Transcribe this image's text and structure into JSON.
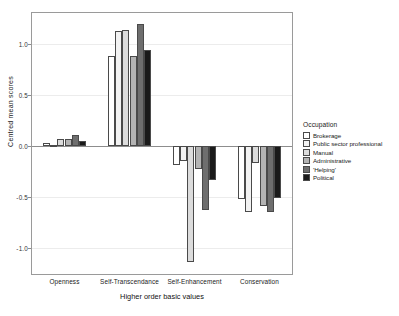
{
  "chart_data": {
    "type": "bar",
    "title": "",
    "xlabel": "Higher order basic values",
    "ylabel": "Centred mean scores",
    "categories": [
      "Openness",
      "Self-Transcendance",
      "Self-Enhancement",
      "Conservation"
    ],
    "ylim": [
      -1.25,
      1.3
    ],
    "yticks": [
      1.0,
      0.5,
      0.0,
      -0.5,
      -1.0
    ],
    "ytick_labels": [
      "1.0",
      "0.5",
      "0.0",
      "-0.5",
      "-1.0"
    ],
    "grid": false,
    "legend_position": "right",
    "legend_title": "Occupation",
    "series": [
      {
        "name": "Brokerage",
        "color": "#ffffff",
        "values": [
          0.03,
          0.88,
          -0.19,
          -0.52
        ]
      },
      {
        "name": "Public sector professional",
        "color": "#f2f2f2",
        "values": [
          0.01,
          1.12,
          -0.15,
          -0.64
        ]
      },
      {
        "name": "Manual",
        "color": "#dcdcdc",
        "values": [
          0.07,
          1.13,
          -1.13,
          -0.17
        ]
      },
      {
        "name": "Administrative",
        "color": "#b4b4b4",
        "values": [
          0.07,
          0.88,
          -0.22,
          -0.59
        ]
      },
      {
        "name": "'Helping'",
        "color": "#6e6e6e",
        "values": [
          0.11,
          1.19,
          -0.62,
          -0.64
        ]
      },
      {
        "name": "Political",
        "color": "#1a1a1a",
        "values": [
          0.05,
          0.94,
          -0.33,
          -0.51
        ]
      }
    ]
  }
}
